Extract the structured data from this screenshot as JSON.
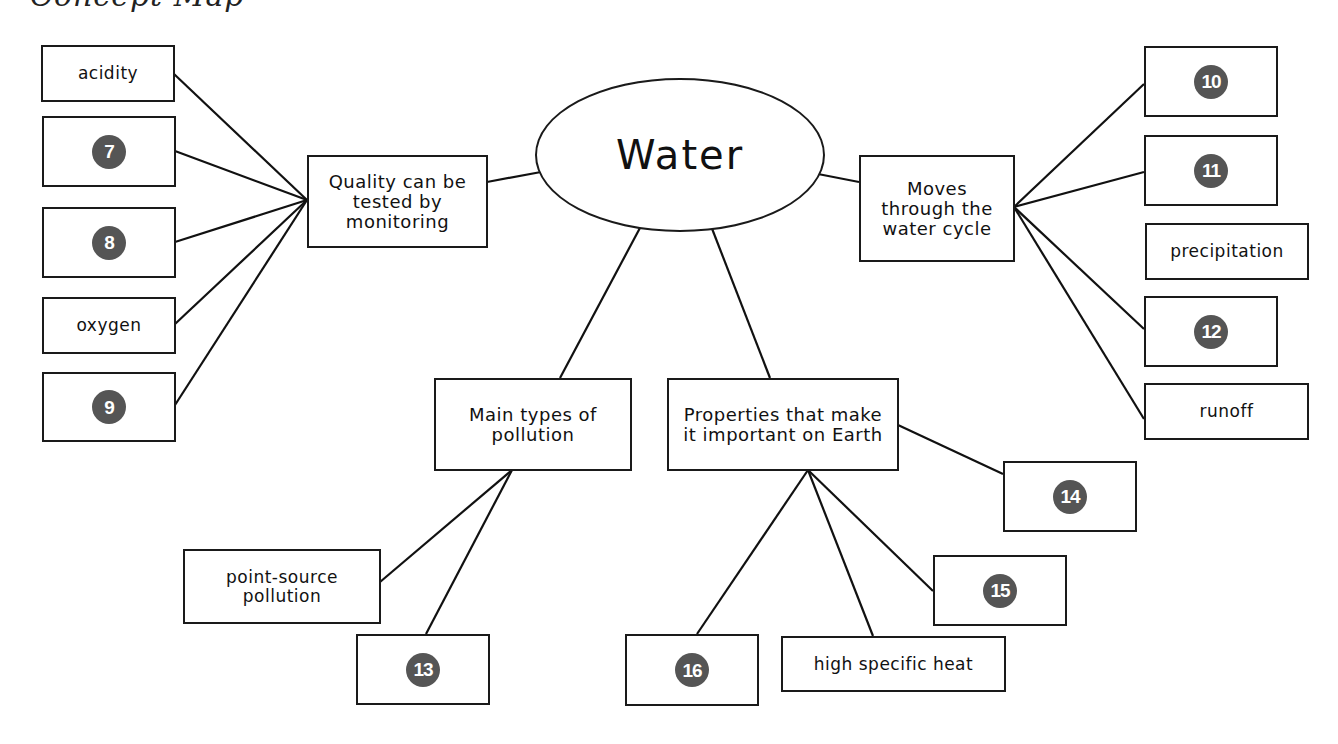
{
  "header": {
    "fragment": "Concept Map"
  },
  "center": {
    "label": "Water"
  },
  "branches": {
    "quality": {
      "label": "Quality can be tested by monitoring",
      "children": [
        {
          "type": "text",
          "label": "acidity"
        },
        {
          "type": "blank",
          "number": "7"
        },
        {
          "type": "blank",
          "number": "8"
        },
        {
          "type": "text",
          "label": "oxygen"
        },
        {
          "type": "blank",
          "number": "9"
        }
      ]
    },
    "water_cycle": {
      "label": "Moves through the water cycle",
      "children": [
        {
          "type": "blank",
          "number": "10"
        },
        {
          "type": "blank",
          "number": "11"
        },
        {
          "type": "text",
          "label": "precipitation"
        },
        {
          "type": "blank",
          "number": "12"
        },
        {
          "type": "text",
          "label": "runoff"
        }
      ]
    },
    "pollution": {
      "label": "Main types of pollution",
      "children": [
        {
          "type": "text",
          "label": "point-source pollution"
        },
        {
          "type": "blank",
          "number": "13"
        }
      ]
    },
    "properties": {
      "label": "Properties that make it important on Earth",
      "children": [
        {
          "type": "blank",
          "number": "14"
        },
        {
          "type": "blank",
          "number": "15"
        },
        {
          "type": "text",
          "label": "high specific heat"
        },
        {
          "type": "blank",
          "number": "16"
        }
      ]
    }
  },
  "colors": {
    "badge": "#555555",
    "stroke": "#1a1a1a",
    "background": "#ffffff"
  }
}
